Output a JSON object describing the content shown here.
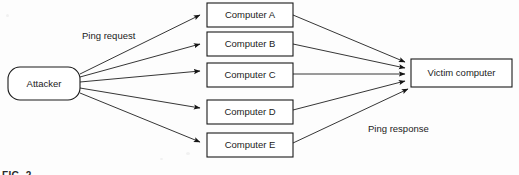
{
  "diagram": {
    "background_color": "#fdfdfd",
    "stroke_color": "#1f1f1f",
    "source": {
      "label": "Attacker",
      "shape": "rounded-rectangle",
      "x": 8,
      "y": 67,
      "width": 72,
      "height": 33
    },
    "target": {
      "label": "Victim computer",
      "shape": "rectangle",
      "x": 411,
      "y": 59,
      "width": 101,
      "height": 28
    },
    "reflectors": [
      {
        "label": "Computer A",
        "x": 207,
        "y": 3,
        "width": 86,
        "height": 24
      },
      {
        "label": "Computer B",
        "x": 207,
        "y": 32,
        "width": 86,
        "height": 24
      },
      {
        "label": "Computer C",
        "x": 207,
        "y": 63,
        "width": 86,
        "height": 24
      },
      {
        "label": "Computer D",
        "x": 207,
        "y": 100,
        "width": 86,
        "height": 24
      },
      {
        "label": "Computer E",
        "x": 207,
        "y": 133,
        "width": 86,
        "height": 24
      }
    ],
    "annotations": [
      {
        "name": "ping-request-label",
        "text": "Ping request",
        "x": 82,
        "y": 36
      },
      {
        "name": "ping-response-label",
        "text": "Ping response",
        "x": 368,
        "y": 129
      }
    ],
    "caption": "FIG. 2"
  }
}
